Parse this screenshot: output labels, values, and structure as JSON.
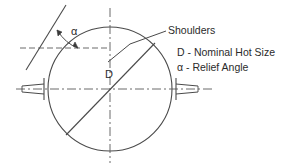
{
  "diagram": {
    "labels": {
      "shoulders": "Shoulders",
      "legend_diameter": "D - Nominal Hot Size",
      "legend_angle": "α - Relief Angle",
      "diameter_symbol": "D",
      "angle_symbol": "α"
    },
    "colors": {
      "line": "#4a4a4a",
      "centerline": "#5a5a5a",
      "text": "#2b2b2b",
      "background": "#ffffff"
    },
    "geometry": {
      "circle_center_x": 110,
      "circle_center_y": 89,
      "circle_radius": 62,
      "horizontal_centerline_y": 89,
      "vertical_centerline_x": 110,
      "upper_reference_line_y": 48,
      "relief_angle_degrees": 30
    }
  }
}
